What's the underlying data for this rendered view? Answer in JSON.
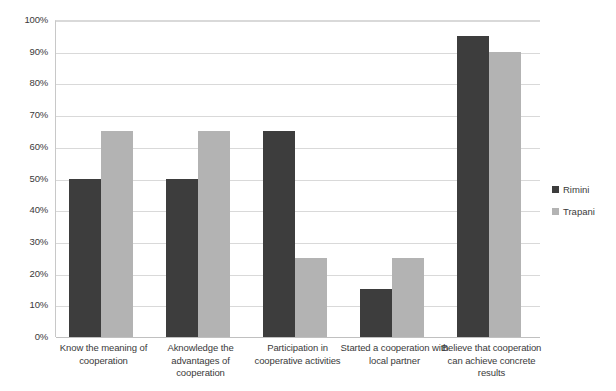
{
  "chart_data": {
    "type": "bar",
    "title": "",
    "xlabel": "",
    "ylabel": "",
    "ylim": [
      0,
      100
    ],
    "grid": true,
    "legend_position": "right",
    "categories": [
      "Know the meaning of cooperation",
      "Aknowledge the advantages of cooperation",
      "Participation in cooperative activities",
      "Started a cooperation with local partner",
      "Believe that cooperation can achieve concrete results"
    ],
    "ticks": [
      "0%",
      "10%",
      "20%",
      "30%",
      "40%",
      "50%",
      "60%",
      "70%",
      "80%",
      "90%",
      "100%"
    ],
    "tick_values": [
      0,
      10,
      20,
      30,
      40,
      50,
      60,
      70,
      80,
      90,
      100
    ],
    "series": [
      {
        "name": "Rimini",
        "color": "#3d3d3d",
        "values": [
          50,
          50,
          65,
          15,
          95
        ]
      },
      {
        "name": "Trapani",
        "color": "#b3b3b3",
        "values": [
          65,
          65,
          25,
          25,
          90
        ]
      }
    ]
  }
}
